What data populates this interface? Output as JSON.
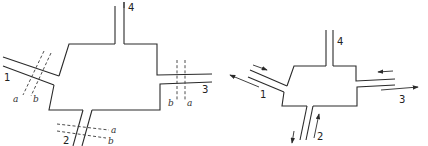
{
  "figure": {
    "left_diagram": {
      "description": "Four-port junction with reference planes a and b on ports 1, 2, 3",
      "ports": [
        {
          "id": "port-1",
          "label": "1"
        },
        {
          "id": "port-2",
          "label": "2"
        },
        {
          "id": "port-3",
          "label": "3"
        },
        {
          "id": "port-4",
          "label": "4"
        }
      ],
      "reference_planes": {
        "port1": {
          "a": "a",
          "b": "b"
        },
        "port2": {
          "a": "a",
          "b": "b"
        },
        "port3": {
          "a": "a",
          "b": "b"
        }
      }
    },
    "right_diagram": {
      "description": "Four-port junction with incident and reflected wave arrows",
      "ports": [
        {
          "id": "port-1",
          "label": "1"
        },
        {
          "id": "port-2",
          "label": "2"
        },
        {
          "id": "port-3",
          "label": "3"
        },
        {
          "id": "port-4",
          "label": "4"
        }
      ]
    },
    "colors": {
      "line": "#2a2a2a",
      "background": "#ffffff"
    }
  }
}
